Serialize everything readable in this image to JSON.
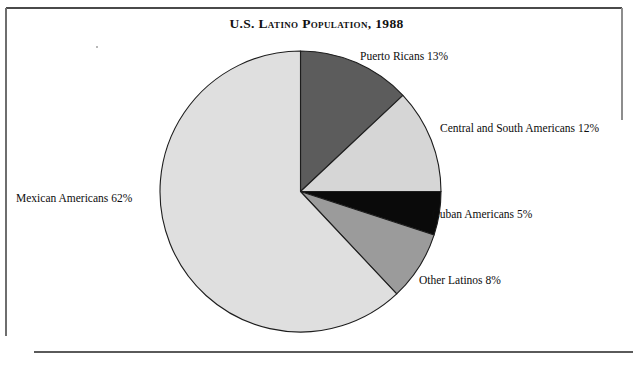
{
  "figure": {
    "title": "U.S. Latino Population, 1988",
    "background": "#ffffff",
    "frame_color": "#4a4a4a"
  },
  "chart_data": {
    "type": "pie",
    "title": "U.S. Latino Population, 1988",
    "xlabel": "",
    "ylabel": "",
    "units": "percent",
    "start_angle_deg": 0,
    "direction": "clockwise",
    "legend_position": "none",
    "labels_placement": "outside-adjacent",
    "grid": false,
    "categories": [
      "Puerto Ricans",
      "Central and South Americans",
      "Cuban Americans",
      "Other Latinos",
      "Mexican Americans"
    ],
    "values": [
      13,
      12,
      5,
      8,
      62
    ],
    "colors": [
      "#5c5c5c",
      "#d6d6d6",
      "#0a0a0a",
      "#9b9b9b",
      "#dfdfdf"
    ],
    "slices": [
      {
        "name": "Puerto Ricans",
        "value": 13,
        "label": "Puerto Ricans 13%",
        "color": "#5c5c5c",
        "swatch_name": "dark-gray"
      },
      {
        "name": "Central and South Americans",
        "value": 12,
        "label": "Central and South Americans 12%",
        "color": "#d6d6d6",
        "swatch_name": "light-gray"
      },
      {
        "name": "Cuban Americans",
        "value": 5,
        "label": "Cuban Americans 5%",
        "color": "#0a0a0a",
        "swatch_name": "black"
      },
      {
        "name": "Other Latinos",
        "value": 8,
        "label": "Other Latinos 8%",
        "color": "#9b9b9b",
        "swatch_name": "medium-gray"
      },
      {
        "name": "Mexican Americans",
        "value": 62,
        "label": "Mexican Americans 62%",
        "color": "#dfdfdf",
        "swatch_name": "pale-gray"
      }
    ]
  }
}
